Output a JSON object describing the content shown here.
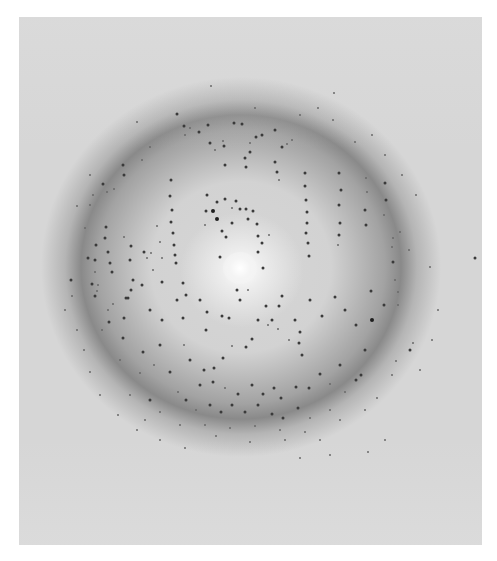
{
  "image": {
    "subject": "x-ray-diffraction-pattern",
    "frame": {
      "x": 19,
      "y": 17,
      "width": 463,
      "height": 528
    },
    "colors": {
      "page_background": "#ffffff",
      "film_background": "#d6d6d6",
      "ring_shadow": "#6a6a6a",
      "beam_center": "#ffffff",
      "spot": "#2b2b2b"
    },
    "beam_center": {
      "x": 240,
      "y": 268
    },
    "spots": [
      [
        211,
        86,
        "s"
      ],
      [
        137,
        122,
        "s"
      ],
      [
        190,
        128,
        "s"
      ],
      [
        250,
        143,
        "s"
      ],
      [
        255,
        108,
        "s"
      ],
      [
        334,
        93,
        "s"
      ],
      [
        177,
        114,
        "m"
      ],
      [
        184,
        126,
        "m"
      ],
      [
        208,
        125,
        "m"
      ],
      [
        234,
        123,
        "m"
      ],
      [
        242,
        124,
        "m"
      ],
      [
        256,
        137,
        "m"
      ],
      [
        199,
        132,
        "m"
      ],
      [
        185,
        135,
        "s"
      ],
      [
        210,
        143,
        "m"
      ],
      [
        224,
        146,
        "m"
      ],
      [
        250,
        152,
        "m"
      ],
      [
        262,
        135,
        "m"
      ],
      [
        275,
        130,
        "m"
      ],
      [
        282,
        147,
        "m"
      ],
      [
        287,
        144,
        "s"
      ],
      [
        292,
        140,
        "s"
      ],
      [
        245,
        158,
        "m"
      ],
      [
        246,
        167,
        "m"
      ],
      [
        223,
        141,
        "s"
      ],
      [
        275,
        162,
        "m"
      ],
      [
        277,
        172,
        "m"
      ],
      [
        279,
        180,
        "s"
      ],
      [
        215,
        150,
        "s"
      ],
      [
        225,
        165,
        "m"
      ],
      [
        207,
        195,
        "m"
      ],
      [
        206,
        211,
        "m"
      ],
      [
        205,
        225,
        "s"
      ],
      [
        217,
        202,
        "m"
      ],
      [
        225,
        199,
        "m"
      ],
      [
        236,
        201,
        "m"
      ],
      [
        246,
        209,
        "m"
      ],
      [
        248,
        219,
        "m"
      ],
      [
        257,
        224,
        "m"
      ],
      [
        258,
        236,
        "m"
      ],
      [
        262,
        243,
        "m"
      ],
      [
        269,
        235,
        "s"
      ],
      [
        213,
        211,
        "l"
      ],
      [
        217,
        219,
        "l"
      ],
      [
        232,
        208,
        "s"
      ],
      [
        240,
        209,
        "m"
      ],
      [
        253,
        211,
        "m"
      ],
      [
        232,
        223,
        "m"
      ],
      [
        222,
        231,
        "m"
      ],
      [
        226,
        237,
        "m"
      ],
      [
        258,
        252,
        "m"
      ],
      [
        263,
        268,
        "m"
      ],
      [
        237,
        290,
        "m"
      ],
      [
        220,
        257,
        "m"
      ],
      [
        171,
        180,
        "m"
      ],
      [
        170,
        196,
        "m"
      ],
      [
        172,
        210,
        "m"
      ],
      [
        171,
        222,
        "m"
      ],
      [
        173,
        233,
        "m"
      ],
      [
        174,
        245,
        "m"
      ],
      [
        175,
        255,
        "m"
      ],
      [
        176,
        263,
        "m"
      ],
      [
        157,
        226,
        "s"
      ],
      [
        160,
        242,
        "s"
      ],
      [
        162,
        258,
        "s"
      ],
      [
        153,
        270,
        "s"
      ],
      [
        305,
        173,
        "m"
      ],
      [
        305,
        186,
        "m"
      ],
      [
        306,
        200,
        "m"
      ],
      [
        307,
        212,
        "m"
      ],
      [
        307,
        223,
        "m"
      ],
      [
        306,
        233,
        "m"
      ],
      [
        308,
        243,
        "m"
      ],
      [
        309,
        256,
        "m"
      ],
      [
        339,
        173,
        "m"
      ],
      [
        341,
        190,
        "m"
      ],
      [
        339,
        205,
        "m"
      ],
      [
        340,
        223,
        "m"
      ],
      [
        339,
        235,
        "m"
      ],
      [
        338,
        245,
        "s"
      ],
      [
        366,
        178,
        "s"
      ],
      [
        367,
        192,
        "s"
      ],
      [
        365,
        210,
        "m"
      ],
      [
        366,
        225,
        "m"
      ],
      [
        385,
        183,
        "m"
      ],
      [
        386,
        200,
        "m"
      ],
      [
        384,
        215,
        "s"
      ],
      [
        392,
        247,
        "s"
      ],
      [
        393,
        262,
        "m"
      ],
      [
        395,
        280,
        "s"
      ],
      [
        103,
        184,
        "m"
      ],
      [
        107,
        192,
        "s"
      ],
      [
        93,
        195,
        "s"
      ],
      [
        123,
        165,
        "m"
      ],
      [
        124,
        175,
        "m"
      ],
      [
        114,
        189,
        "s"
      ],
      [
        96,
        245,
        "m"
      ],
      [
        95,
        260,
        "m"
      ],
      [
        95,
        272,
        "s"
      ],
      [
        98,
        285,
        "s"
      ],
      [
        90,
        205,
        "s"
      ],
      [
        85,
        228,
        "s"
      ],
      [
        106,
        227,
        "m"
      ],
      [
        105,
        238,
        "m"
      ],
      [
        108,
        252,
        "m"
      ],
      [
        110,
        263,
        "m"
      ],
      [
        112,
        272,
        "m"
      ],
      [
        88,
        258,
        "m"
      ],
      [
        92,
        284,
        "m"
      ],
      [
        97,
        291,
        "s"
      ],
      [
        131,
        246,
        "m"
      ],
      [
        130,
        260,
        "m"
      ],
      [
        133,
        280,
        "m"
      ],
      [
        131,
        290,
        "m"
      ],
      [
        144,
        252,
        "m"
      ],
      [
        151,
        253,
        "s"
      ],
      [
        124,
        237,
        "s"
      ],
      [
        142,
        285,
        "m"
      ],
      [
        147,
        258,
        "s"
      ],
      [
        126,
        298,
        "m"
      ],
      [
        71,
        280,
        "m"
      ],
      [
        72,
        296,
        "s"
      ],
      [
        65,
        310,
        "s"
      ],
      [
        77,
        330,
        "s"
      ],
      [
        84,
        350,
        "s"
      ],
      [
        90,
        372,
        "s"
      ],
      [
        95,
        296,
        "m"
      ],
      [
        113,
        304,
        "s"
      ],
      [
        128,
        298,
        "m"
      ],
      [
        162,
        282,
        "m"
      ],
      [
        183,
        283,
        "m"
      ],
      [
        186,
        295,
        "m"
      ],
      [
        124,
        318,
        "m"
      ],
      [
        123,
        338,
        "m"
      ],
      [
        120,
        360,
        "s"
      ],
      [
        108,
        310,
        "s"
      ],
      [
        109,
        322,
        "m"
      ],
      [
        102,
        330,
        "s"
      ],
      [
        150,
        310,
        "m"
      ],
      [
        162,
        320,
        "m"
      ],
      [
        177,
        300,
        "m"
      ],
      [
        183,
        318,
        "m"
      ],
      [
        200,
        300,
        "m"
      ],
      [
        207,
        312,
        "m"
      ],
      [
        206,
        330,
        "m"
      ],
      [
        222,
        316,
        "m"
      ],
      [
        229,
        318,
        "m"
      ],
      [
        240,
        300,
        "m"
      ],
      [
        248,
        290,
        "s"
      ],
      [
        258,
        320,
        "m"
      ],
      [
        266,
        306,
        "m"
      ],
      [
        279,
        306,
        "m"
      ],
      [
        282,
        296,
        "m"
      ],
      [
        272,
        320,
        "m"
      ],
      [
        295,
        320,
        "m"
      ],
      [
        300,
        332,
        "m"
      ],
      [
        302,
        355,
        "m"
      ],
      [
        310,
        300,
        "m"
      ],
      [
        322,
        316,
        "m"
      ],
      [
        335,
        297,
        "m"
      ],
      [
        345,
        310,
        "m"
      ],
      [
        371,
        291,
        "m"
      ],
      [
        372,
        320,
        "l"
      ],
      [
        384,
        305,
        "m"
      ],
      [
        398,
        305,
        "s"
      ],
      [
        398,
        292,
        "s"
      ],
      [
        413,
        343,
        "s"
      ],
      [
        410,
        350,
        "m"
      ],
      [
        356,
        325,
        "m"
      ],
      [
        365,
        350,
        "m"
      ],
      [
        361,
        375,
        "m"
      ],
      [
        345,
        392,
        "s"
      ],
      [
        356,
        380,
        "m"
      ],
      [
        340,
        365,
        "m"
      ],
      [
        160,
        345,
        "m"
      ],
      [
        143,
        352,
        "m"
      ],
      [
        140,
        373,
        "s"
      ],
      [
        154,
        365,
        "s"
      ],
      [
        170,
        372,
        "m"
      ],
      [
        178,
        392,
        "s"
      ],
      [
        184,
        345,
        "s"
      ],
      [
        190,
        360,
        "m"
      ],
      [
        204,
        370,
        "m"
      ],
      [
        214,
        368,
        "m"
      ],
      [
        223,
        358,
        "m"
      ],
      [
        232,
        346,
        "s"
      ],
      [
        246,
        347,
        "m"
      ],
      [
        252,
        339,
        "m"
      ],
      [
        268,
        325,
        "s"
      ],
      [
        278,
        329,
        "s"
      ],
      [
        289,
        340,
        "s"
      ],
      [
        299,
        343,
        "m"
      ],
      [
        200,
        385,
        "m"
      ],
      [
        213,
        382,
        "m"
      ],
      [
        225,
        388,
        "s"
      ],
      [
        238,
        394,
        "m"
      ],
      [
        252,
        385,
        "m"
      ],
      [
        263,
        394,
        "m"
      ],
      [
        274,
        388,
        "m"
      ],
      [
        281,
        398,
        "m"
      ],
      [
        296,
        387,
        "m"
      ],
      [
        309,
        388,
        "m"
      ],
      [
        320,
        374,
        "m"
      ],
      [
        330,
        384,
        "s"
      ],
      [
        186,
        400,
        "m"
      ],
      [
        196,
        410,
        "s"
      ],
      [
        210,
        405,
        "m"
      ],
      [
        221,
        412,
        "m"
      ],
      [
        232,
        405,
        "m"
      ],
      [
        245,
        412,
        "m"
      ],
      [
        258,
        405,
        "m"
      ],
      [
        272,
        414,
        "m"
      ],
      [
        283,
        418,
        "m"
      ],
      [
        298,
        408,
        "m"
      ],
      [
        310,
        418,
        "s"
      ],
      [
        330,
        410,
        "s"
      ],
      [
        150,
        400,
        "m"
      ],
      [
        160,
        412,
        "s"
      ],
      [
        130,
        395,
        "s"
      ],
      [
        145,
        420,
        "s"
      ],
      [
        180,
        425,
        "s"
      ],
      [
        205,
        425,
        "s"
      ],
      [
        230,
        428,
        "s"
      ],
      [
        255,
        426,
        "s"
      ],
      [
        280,
        430,
        "s"
      ],
      [
        305,
        432,
        "s"
      ],
      [
        340,
        420,
        "s"
      ],
      [
        365,
        410,
        "s"
      ],
      [
        377,
        398,
        "s"
      ],
      [
        392,
        375,
        "s"
      ],
      [
        396,
        361,
        "s"
      ],
      [
        320,
        440,
        "s"
      ],
      [
        285,
        440,
        "s"
      ],
      [
        250,
        442,
        "s"
      ],
      [
        216,
        436,
        "s"
      ],
      [
        400,
        232,
        "s"
      ],
      [
        409,
        250,
        "s"
      ],
      [
        475,
        258,
        "m"
      ],
      [
        430,
        267,
        "s"
      ],
      [
        393,
        238,
        "s"
      ],
      [
        385,
        155,
        "s"
      ],
      [
        372,
        135,
        "s"
      ],
      [
        402,
        175,
        "s"
      ],
      [
        416,
        195,
        "s"
      ],
      [
        355,
        142,
        "s"
      ],
      [
        333,
        120,
        "s"
      ],
      [
        318,
        108,
        "s"
      ],
      [
        300,
        115,
        "s"
      ],
      [
        150,
        147,
        "s"
      ],
      [
        142,
        160,
        "s"
      ],
      [
        90,
        175,
        "s"
      ],
      [
        77,
        206,
        "s"
      ],
      [
        385,
        440,
        "s"
      ],
      [
        368,
        452,
        "s"
      ],
      [
        330,
        455,
        "s"
      ],
      [
        300,
        458,
        "s"
      ],
      [
        185,
        448,
        "s"
      ],
      [
        160,
        440,
        "s"
      ],
      [
        137,
        430,
        "s"
      ],
      [
        118,
        415,
        "s"
      ],
      [
        100,
        395,
        "s"
      ],
      [
        420,
        370,
        "s"
      ],
      [
        432,
        340,
        "s"
      ],
      [
        438,
        310,
        "s"
      ]
    ]
  }
}
